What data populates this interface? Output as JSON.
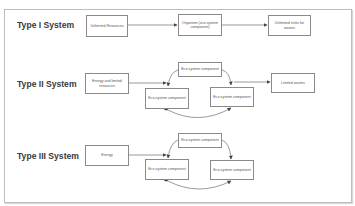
{
  "diagram": {
    "rows": [
      {
        "label": "Type I System",
        "boxes": {
          "input": "Unlimited Resources",
          "center": "Organism (eco-system component)",
          "output": "Unlimited sinks for wastes"
        }
      },
      {
        "label": "Type II System",
        "boxes": {
          "input": "Energy and limited resources",
          "top": "Eco-system component",
          "left": "Eco-system component",
          "right": "Eco-system component",
          "output": "Limited wastes"
        }
      },
      {
        "label": "Type III System",
        "boxes": {
          "input": "Energy",
          "top": "Eco-system component",
          "left": "Eco-system component",
          "right": "Eco-system component"
        }
      }
    ],
    "colors": {
      "border": "#8a8a8a",
      "text": "#555555",
      "label": "#3a3a3a",
      "frame": "#bdbdbd"
    }
  }
}
